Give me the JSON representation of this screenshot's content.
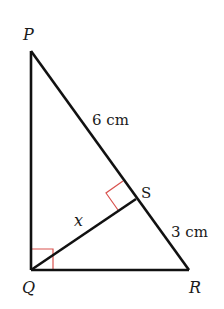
{
  "diagram": {
    "type": "right triangle with altitude",
    "vertices": {
      "P": {
        "label": "P",
        "x": 31,
        "y": 51
      },
      "Q": {
        "label": "Q",
        "x": 31,
        "y": 270
      },
      "R": {
        "label": "R",
        "x": 189,
        "y": 270
      },
      "S": {
        "label": "S",
        "x": 136,
        "y": 199
      }
    },
    "labels": {
      "P": "P",
      "Q": "Q",
      "R": "R",
      "S": "S",
      "PS": "6 cm",
      "SR": "3 cm",
      "QS": "x"
    },
    "right_angles": [
      "PQR",
      "QSP"
    ],
    "colors": {
      "lines": "#111111",
      "right_angle_marks": "#d9534f"
    }
  }
}
